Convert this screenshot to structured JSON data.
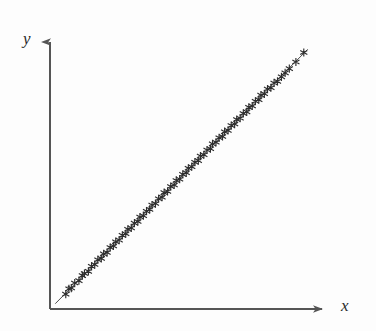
{
  "figure": {
    "background_color": "#fdfdfd",
    "width": 376,
    "height": 331
  },
  "axes": {
    "x_label": "x",
    "y_label": "y",
    "axis_color": "#555555",
    "origin_px": [
      50,
      309
    ],
    "x_axis_end_px": [
      325,
      309
    ],
    "y_axis_end_px": [
      50,
      38
    ],
    "arrowheads": true,
    "ticks": false,
    "tick_labels": [],
    "grid": false
  },
  "chart_data": {
    "type": "scatter",
    "title": "",
    "xlabel": "x",
    "ylabel": "y",
    "xlim": [
      0,
      100
    ],
    "ylim": [
      0,
      100
    ],
    "grid": false,
    "legend": null,
    "marker": "asterisk",
    "marker_color": "#2e2e2e",
    "fit_line": {
      "visible": true,
      "color": "#4a4a4a",
      "slope": 1.0,
      "intercept": 0.0,
      "x_start": 2.0,
      "x_end": 98.0
    },
    "x": [
      6.0,
      7.2,
      8.1,
      9.4,
      11.0,
      12.3,
      13.1,
      14.6,
      15.8,
      17.0,
      18.2,
      19.5,
      20.4,
      21.7,
      22.9,
      24.1,
      25.0,
      26.3,
      27.5,
      28.8,
      29.6,
      30.9,
      32.1,
      33.4,
      34.2,
      35.5,
      36.7,
      37.9,
      38.8,
      40.1,
      41.3,
      42.6,
      43.4,
      44.7,
      45.9,
      47.2,
      48.0,
      49.3,
      50.5,
      51.8,
      52.6,
      53.9,
      55.1,
      56.4,
      57.2,
      58.5,
      59.7,
      61.0,
      61.8,
      63.1,
      64.3,
      65.6,
      66.4,
      67.7,
      68.9,
      70.2,
      71.0,
      72.3,
      73.5,
      74.8,
      75.6,
      76.9,
      78.1,
      79.4,
      80.2,
      81.5,
      82.7,
      84.0,
      85.2,
      86.5,
      88.0,
      89.4,
      91.0,
      93.5,
      96.5
    ],
    "y": [
      5.6,
      7.6,
      7.9,
      9.8,
      10.7,
      12.6,
      13.4,
      14.2,
      16.1,
      16.8,
      18.6,
      19.1,
      20.8,
      21.3,
      23.2,
      23.8,
      25.4,
      26.0,
      27.8,
      28.4,
      30.1,
      30.6,
      32.4,
      33.0,
      34.7,
      35.2,
      36.9,
      37.6,
      39.2,
      39.8,
      41.6,
      42.2,
      43.9,
      44.4,
      46.2,
      46.8,
      48.5,
      49.0,
      50.8,
      51.4,
      53.1,
      53.7,
      55.4,
      56.0,
      57.7,
      58.2,
      60.0,
      60.5,
      62.3,
      62.9,
      64.6,
      65.1,
      66.9,
      67.4,
      69.2,
      69.8,
      71.5,
      72.0,
      73.8,
      74.4,
      76.1,
      76.6,
      78.4,
      79.0,
      80.7,
      81.2,
      83.0,
      83.5,
      85.3,
      85.9,
      87.6,
      89.1,
      90.7,
      93.2,
      96.8
    ]
  }
}
